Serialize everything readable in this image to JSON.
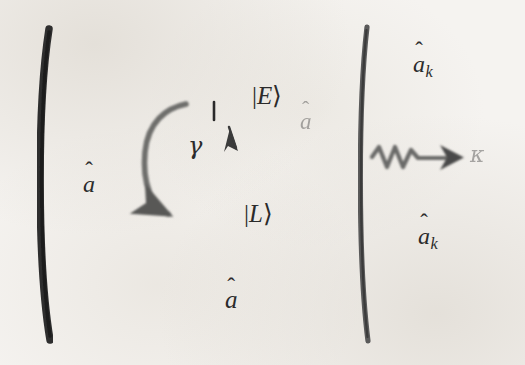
{
  "figure": {
    "type": "schematic",
    "background_color": "#f5f3f0",
    "ink_color": "#2b2b2b",
    "faded_ink_color": "#8a8a88"
  },
  "mirrors": {
    "left": {
      "name": "left-cavity-mirror",
      "shape": "concave-arc",
      "color": "#2f2f2f"
    },
    "right": {
      "name": "right-cavity-mirror",
      "shape": "concave-arc",
      "color": "#4a4a4a"
    }
  },
  "levels": [
    {
      "id": "excited",
      "ket": "|E⟩",
      "bar": "|",
      "letter": "E",
      "close": "⟩",
      "color": "#2b2b2b"
    },
    {
      "id": "lower",
      "ket": "|L⟩",
      "bar": "|",
      "letter": "L",
      "close": "⟩",
      "color": "#2b2b2b"
    }
  ],
  "labels": {
    "input_a": {
      "letter": "a",
      "hat": "̂",
      "text": "â"
    },
    "cavity_span_a": {
      "letter": "a",
      "hat": "̂",
      "text": "â"
    },
    "center_a": {
      "letter": "a",
      "hat": "̂",
      "text": "â",
      "faded": true
    },
    "gamma": {
      "symbol": "γ",
      "meaning": "spontaneous-emission-rate"
    },
    "kappa": {
      "symbol": "κ",
      "meaning": "cavity-decay-rate",
      "faded": true
    },
    "a_k_top": {
      "letter": "a",
      "hat": "̂",
      "sub": "k",
      "text": "âₖ"
    },
    "a_k_bottom": {
      "letter": "a",
      "hat": "̂",
      "sub": "k",
      "text": "âₖ"
    }
  },
  "arrows": [
    {
      "name": "input-a-arrow",
      "direction": "right",
      "style": "solid",
      "label": "â"
    },
    {
      "name": "gamma-decay-arrow",
      "direction": "curved-down",
      "style": "solid-gray",
      "label": "γ"
    },
    {
      "name": "excited-down-arrow",
      "direction": "down",
      "style": "solid",
      "label": ""
    },
    {
      "name": "center-a-arrow",
      "direction": "right",
      "style": "solid",
      "label": "â"
    },
    {
      "name": "kappa-wavy-arrow",
      "direction": "right",
      "style": "wavy",
      "label": "κ"
    },
    {
      "name": "a-k-top-arrow",
      "direction": "left",
      "style": "solid",
      "label": "âₖ"
    },
    {
      "name": "a-k-bottom-arrow",
      "direction": "left",
      "style": "solid",
      "label": "âₖ"
    },
    {
      "name": "cavity-span-arrow",
      "direction": "double",
      "style": "solid",
      "label": "â"
    }
  ]
}
